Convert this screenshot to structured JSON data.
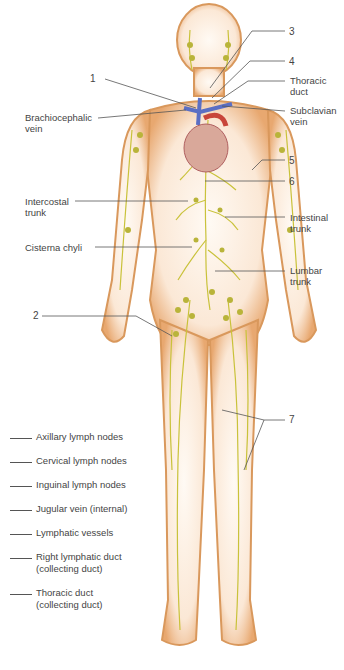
{
  "figure": {
    "colors": {
      "skin_outline": "#d9985c",
      "skin_fill": "#fbeee2",
      "lymph_vessels": "#c9c23a",
      "lymph_nodes": "#b9b43a",
      "vein_blue": "#5b6fc4",
      "heart_red": "#c8453a",
      "leader_line": "#555555"
    }
  },
  "numbered_labels": [
    {
      "id": "1",
      "text": "1"
    },
    {
      "id": "2",
      "text": "2"
    },
    {
      "id": "3",
      "text": "3"
    },
    {
      "id": "4",
      "text": "4"
    },
    {
      "id": "5",
      "text": "5"
    },
    {
      "id": "6",
      "text": "6"
    },
    {
      "id": "7",
      "text": "7"
    }
  ],
  "text_labels": {
    "brachiocephalic_vein": {
      "line1": "Brachiocephalic",
      "line2": "vein"
    },
    "thoracic_duct": {
      "line1": "Thoracic",
      "line2": "duct"
    },
    "subclavian_vein": {
      "line1": "Subclavian",
      "line2": "vein"
    },
    "intercostal_trunk": {
      "line1": "Intercostal",
      "line2": "trunk"
    },
    "intestinal_trunk": {
      "line1": "Intestinal",
      "line2": "trunk"
    },
    "cisterna_chyli": {
      "line1": "Cisterna chyli"
    },
    "lumbar_trunk": {
      "line1": "Lumbar",
      "line2": "trunk"
    }
  },
  "legend": {
    "items": [
      {
        "line1": "Axillary lymph nodes"
      },
      {
        "line1": "Cervical lymph nodes"
      },
      {
        "line1": "Inguinal lymph nodes"
      },
      {
        "line1": "Jugular vein (internal)"
      },
      {
        "line1": "Lymphatic vessels"
      },
      {
        "line1": "Right lymphatic duct",
        "line2": "(collecting duct)"
      },
      {
        "line1": "Thoracic duct",
        "line2": "(collecting duct)"
      }
    ]
  }
}
